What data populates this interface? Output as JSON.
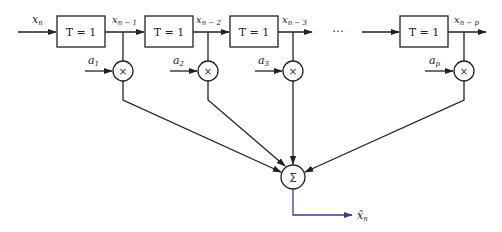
{
  "diagram": {
    "title": "",
    "input": {
      "label": "x",
      "sub": "n"
    },
    "delay_blocks": [
      {
        "label": "T = 1",
        "output_label": "x",
        "output_sub": "n − 1"
      },
      {
        "label": "T = 1",
        "output_label": "x",
        "output_sub": "n − 2"
      },
      {
        "label": "T = 1",
        "output_label": "x",
        "output_sub": "n − 3"
      },
      {
        "label": "T = 1",
        "output_label": "x",
        "output_sub": "n − p"
      }
    ],
    "ellipsis": "···",
    "coefficients": [
      {
        "label": "a",
        "sub": "1"
      },
      {
        "label": "a",
        "sub": "2"
      },
      {
        "label": "a",
        "sub": "3"
      },
      {
        "label": "a",
        "sub": "p"
      }
    ],
    "multiplier_symbol": "×",
    "summer_symbol": "Σ",
    "output": {
      "label": "x̂",
      "sub": "n"
    },
    "colors": {
      "stroke": "#222222",
      "output_line": "#3a3a8a"
    }
  }
}
